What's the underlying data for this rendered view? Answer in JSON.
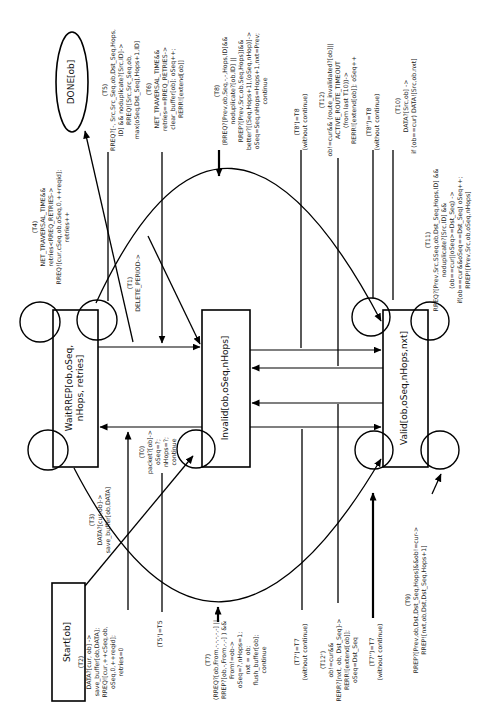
{
  "figure": {
    "type": "state-machine-diagram",
    "orientation": "labels rotated 90 degrees, read bottom-to-top"
  },
  "states": {
    "done": {
      "label": "DONE[ob]"
    },
    "waitrrep": {
      "label": "WaitRREP[ob,oSeq,\nnHops, retries]"
    },
    "invalid": {
      "label": "Invalid[ob,oSeq,nHops]"
    },
    "valid": {
      "label": "Valid[ob,oSeq,nHops,nxt]"
    },
    "start": {
      "label": "Start[ob]"
    }
  },
  "transitions": {
    "t0": {
      "label": "(T0)\npacket?[ob]->\noSeq=?;\nnHops=?;\ncontinue"
    },
    "t1": {
      "label": "(T1)\nDELETE_PERIOD->"
    },
    "t2": {
      "label": "(T2)\nDATA?[cur, ob] ->\nsave_buffer[ob,DATA];\nRREQ![cur,++cSeq,ob,\noSeq,0,++reqid];\nretries=0"
    },
    "t3": {
      "label": "(T3)\nDATA?[cur,ob]->\nsave_buffer[ob,DATA]"
    },
    "t4": {
      "label": "(T4)\nNET_TRAVERSAL_TIME&&\nretries<RREQ_RETRIES->\nRREQ![cur,cSeq,ob,oSeq,0,++reqid];\nretries++"
    },
    "t5": {
      "label": "(T5)\nRREQ?[-, Src,Src_Seq,ob,Dst_Seq,Hops,\nID] && noduplicate?[Src,ID]->\nRREQ![Src,Src_Seq,ob,\nmax(oSeq,Dst_Seq),Hops+1,ID]"
    },
    "t5p": {
      "label": "(T5')=T5"
    },
    "t6": {
      "label": "(T6)\nNET_TRAVERSAL_TIME&&\nretries==RREQ_RETRIES->\nclear_buffer[ob]; oSeq++;\nRERR![extend[ob]]"
    },
    "t7": {
      "label": "(T7)\n(RREQ?[ob,From,-,-,-,-,-] ||\nRREP?[ob,-,From,-,-] ) &&\nFrom!=ob->\noSeq=?,nHops=1;\nnxt = ob;\nflush_buffer[ob];\ncontinue"
    },
    "t7p": {
      "label": "(T7')=T7\n(without continue)"
    },
    "t7pp": {
      "label": "(T7'')=T7\n(without continue)"
    },
    "t8": {
      "label": "(T8)\n(RREQ?[Prev,ob,Seq,-,-,Hops,ID]&&\nnoduplicate?[ob,ID] ||\nRREP?[Prev,Src,ob,Seq,Hops])&&\nbetter?[(Seq,Hops+1),(oSeq,nHop)]->\noSeq=Seq,nHops=Hops+1,nxt=Prev;\ncontinue"
    },
    "t8p": {
      "label": "(T8')=T8\n(without continue)"
    },
    "t8pp": {
      "label": "(T8'')=T8\n(without continue)"
    },
    "t9": {
      "label": "(T9)\nRREP?[Prev,ob,Dst,Dst_Seq,Hops]&&ob!=cur->\nRREP![nxt,ob,Dst,Dst_Seq,Hops+1]"
    },
    "t10": {
      "label": "(T10)\nDATA?[Src,ob] ->\nif (ob==cur) DATA![Src,ob.nxt]"
    },
    "t11": {
      "label": "(T11)\nRREQ?[Prev,Src,SSeq,ob,Dst_Seq,Hops,ID] &&\nnoduplicate?[Src,ID] &&\n(ob==cur||oSeq>=Dst_Seq) ->\nif(ob==cur&&oSeq==Dst_Seq) oSeq++;\nRREP![Prev,Src,ob,oSeq,nHops]"
    },
    "t12": {
      "label": "(T12)\nob!=cur&& (route_invalidated?[ob]||\nACTIVE_ROUTE_TIMEOUT\n(from last T10))->\nRERR![extend[ob]]; oSeq++"
    },
    "t12p": {
      "label": "(T12')\nob!=cur&&\nRERR?[nxt, ob, Dst_Seq]->\nRERR![extend[ob]];\noSeq=Dst_Seq"
    }
  },
  "colors": {
    "stroke": "#000000",
    "background": "#ffffff",
    "text": "#222222"
  }
}
